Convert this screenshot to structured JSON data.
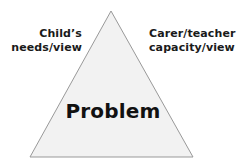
{
  "diagram": {
    "background_color": "#ffffff",
    "shape": {
      "name": "triangle",
      "fill_color": "#f2f2f2",
      "stroke_color": "#999999",
      "apex": "111,11",
      "base_left": "30,157",
      "base_right": "193,157"
    },
    "center_label": "Problem",
    "labels": {
      "left": {
        "line1": "Child’s",
        "line2": "needs/view"
      },
      "right": {
        "line1": "Carer/teacher",
        "line2": "capacity/view"
      }
    },
    "text_color": "#1a1a1a"
  }
}
